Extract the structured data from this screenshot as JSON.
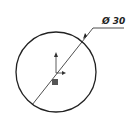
{
  "drawing": {
    "dimension_label": "Ø 30",
    "shape": "circle",
    "stroke_color": "#222222",
    "origin_marker_color": "#555555"
  }
}
